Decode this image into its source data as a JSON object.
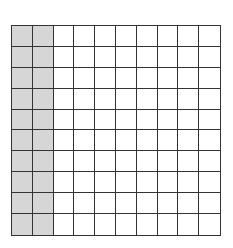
{
  "diagram": {
    "type": "hundred-grid",
    "rows": 10,
    "cols": 10,
    "shaded_columns": 2,
    "shaded_cells": 20,
    "total_cells": 100,
    "colors": {
      "shaded": "#d6d6d6",
      "unshaded": "#ffffff",
      "line": "#333333"
    }
  }
}
